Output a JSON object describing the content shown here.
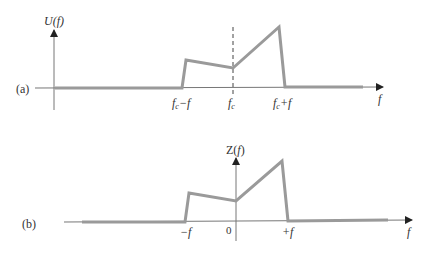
{
  "panel_a": {
    "tag": "(a)",
    "y_label": "U(f)",
    "x_label": "f",
    "ticks": [
      "fc−f",
      "fc",
      "fc+f"
    ],
    "tick_parts": [
      {
        "base": "f",
        "sub": "c",
        "suffix": "−f"
      },
      {
        "base": "f",
        "sub": "c",
        "suffix": ""
      },
      {
        "base": "f",
        "sub": "c",
        "suffix": "+f"
      }
    ],
    "dashed_marker_at": "fc"
  },
  "panel_b": {
    "tag": "(b)",
    "y_label": "Z(f)",
    "x_label": "f",
    "ticks": [
      "−f",
      "0",
      "+f"
    ]
  },
  "colors": {
    "spectrum": "#9a9a9a",
    "axis": "#666666",
    "text": "#333333"
  }
}
